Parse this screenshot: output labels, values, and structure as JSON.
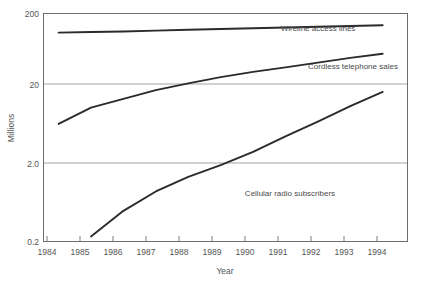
{
  "chart_data": {
    "type": "line",
    "title": "",
    "xlabel": "Year",
    "ylabel": "Millions",
    "xlim": [
      1983.55,
      1994.75
    ],
    "ylim": [
      0.2,
      200
    ],
    "yscale": "log",
    "grid": true,
    "legend_position": "inline-labels",
    "x": [
      1984,
      1985,
      1986,
      1987,
      1988,
      1989,
      1990,
      1991,
      1992,
      1993,
      1994
    ],
    "xtick_labels": [
      "1984",
      "1985",
      "1986",
      "1987",
      "1988",
      "1989",
      "1990",
      "1991",
      "1992",
      "1993",
      "1994"
    ],
    "ytick_labels": [
      "200",
      "20",
      "2.0",
      "0.2"
    ],
    "ytick_values": [
      200,
      20,
      2.0,
      0.2
    ],
    "series": [
      {
        "name": "Wireline access lines",
        "label": "Wireline access lines",
        "values": [
          112,
          114,
          116,
          119,
          122,
          125,
          128,
          131,
          134,
          137,
          140
        ]
      },
      {
        "name": "Cordless telephone sales",
        "label": "Cordless telephone sales",
        "values": [
          7.0,
          11.5,
          15.0,
          19.5,
          24.0,
          29.0,
          34.0,
          39.0,
          45.0,
          52.0,
          59.0
        ]
      },
      {
        "name": "Cellular radio subscribers",
        "label": "Cellular radio subscribers",
        "values": [
          null,
          0.23,
          0.5,
          0.9,
          1.4,
          2.0,
          3.0,
          4.8,
          7.5,
          12.0,
          18.5
        ]
      }
    ],
    "annotations": [
      {
        "text": "Wireline access lines",
        "x_px": 318,
        "y_px": 31
      },
      {
        "text": "Cordless telephone sales",
        "x_px": 353,
        "y_px": 69
      },
      {
        "text": "Cellular radio subscribers",
        "x_px": 290,
        "y_px": 196
      }
    ]
  },
  "colors": {
    "line": "#2b2b2b",
    "grid": "#9a9a9a",
    "frame": "#6e6e6e",
    "text": "#555555",
    "background": "#ffffff"
  }
}
